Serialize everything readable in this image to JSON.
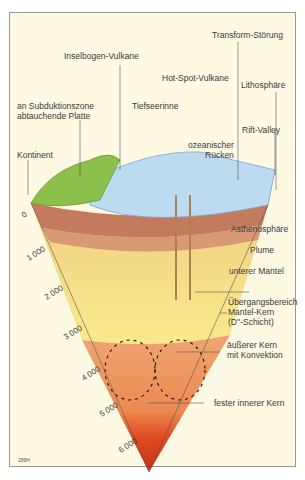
{
  "diagram": {
    "title": "",
    "code": "289H",
    "labels": {
      "inselbogen": "Inselbogen-Vulkane",
      "hotspot": "Hot-Spot-Vulkane",
      "transform": "Transform-Störung",
      "subduktion_1": "an Subduktionszone",
      "subduktion_2": "abtauchende Platte",
      "tiefseerinne": "Tiefseerinne",
      "lithosphaere": "Lithosphäre",
      "kontinent": "Kontinent",
      "rift": "Rift-Valley",
      "ruecken_1": "ozeanischer",
      "ruecken_2": "Rücken",
      "asthenosphaere": "Asthenosphäre",
      "plume": "Plume",
      "unterer_mantel": "unterer Mantel",
      "uebergang_1": "Übergangsbereich",
      "uebergang_2": "Mantel-Kern",
      "uebergang_3": "(D''-Schicht)",
      "aeusserer_1": "äußerer Kern",
      "aeusserer_2": "mit Konvektion",
      "innerer": "fester innerer Kern"
    },
    "depth_scale": [
      "0",
      "1 000",
      "2 000",
      "3 000",
      "4 000",
      "5 000",
      "6 000"
    ],
    "colors": {
      "background": "#fdf9e3",
      "continent": "#8cc04a",
      "ocean": "#bcdaf0",
      "lithosphere": "#b86a50",
      "upper_mantle": "#f3d98a",
      "lower_mantle": "#f8e58a",
      "outer_core": "#f0a06a",
      "inner_core": "#d8301a"
    }
  }
}
